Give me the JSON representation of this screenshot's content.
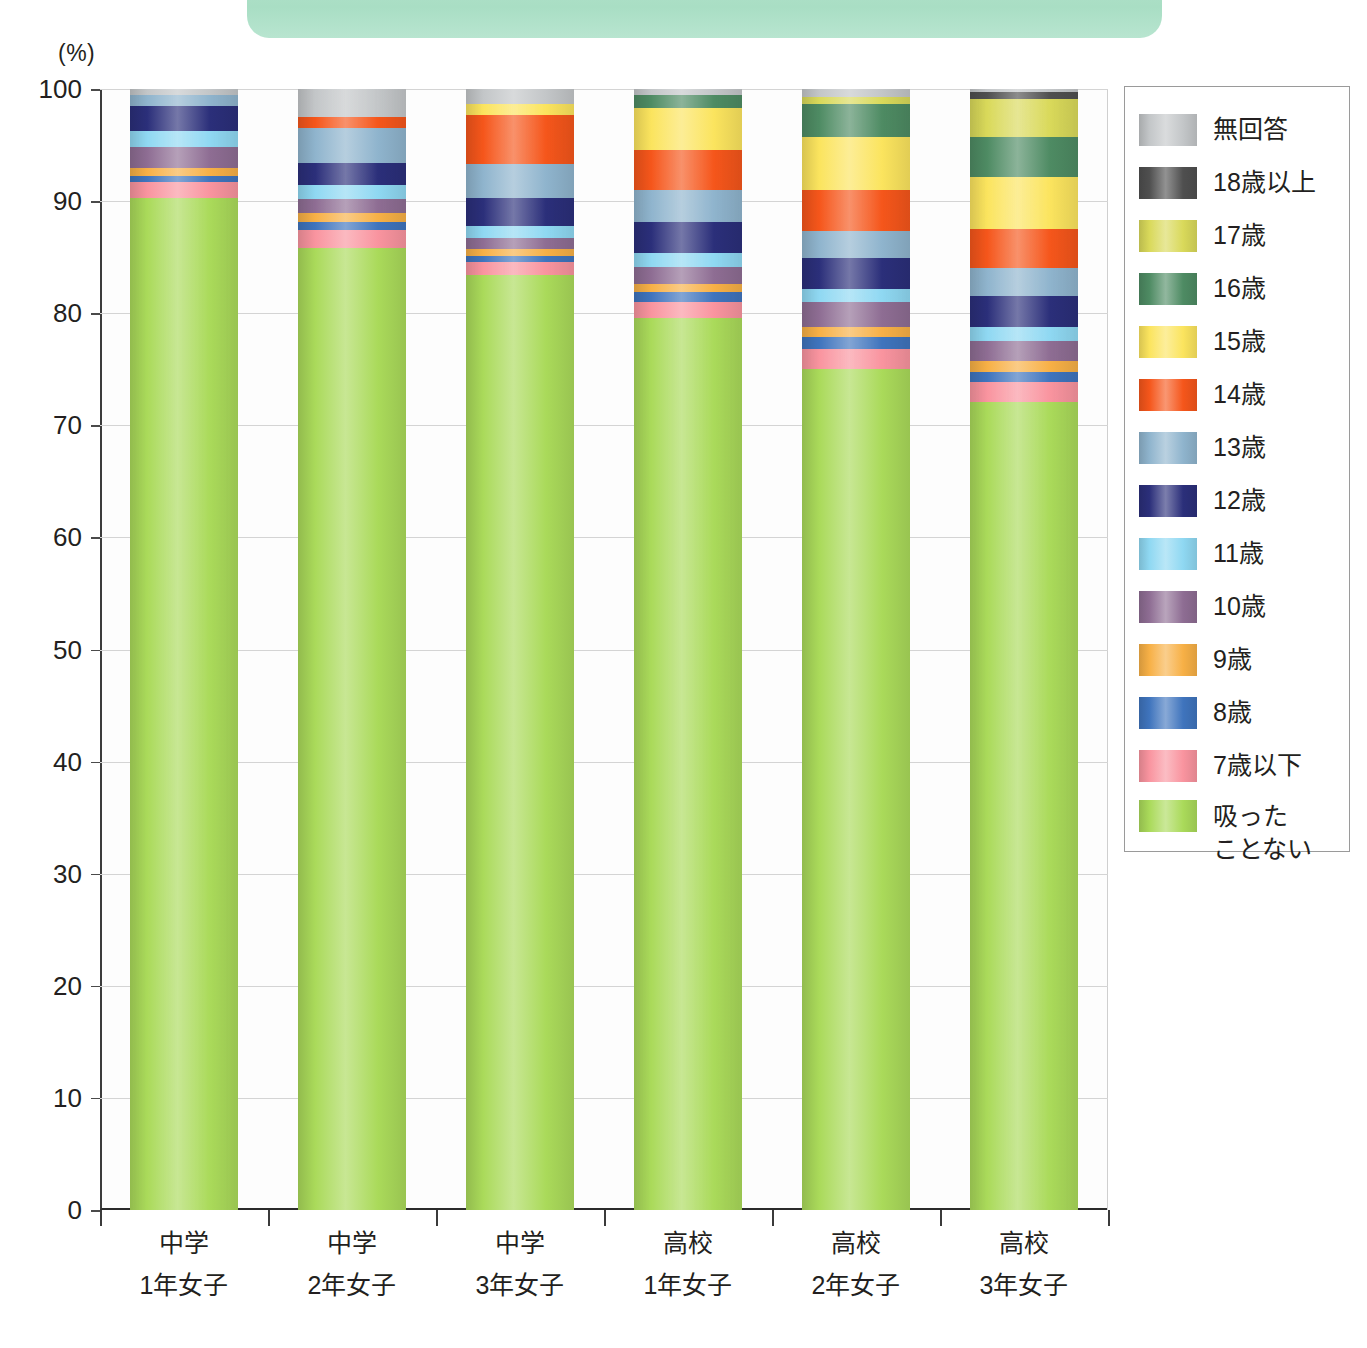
{
  "banner": {
    "label": ""
  },
  "axis": {
    "unit_label": "(%)",
    "y_ticks": [
      "100",
      "90",
      "80",
      "70",
      "60",
      "50",
      "40",
      "30",
      "20",
      "10",
      "0"
    ],
    "y_min": 0,
    "y_max": 100
  },
  "legend": {
    "items": [
      {
        "label": "無回答",
        "color": "#c3c6c8"
      },
      {
        "label": "18歳以上",
        "color": "#4f4f4f"
      },
      {
        "label": "17歳",
        "color": "#d9d95a"
      },
      {
        "label": "16歳",
        "color": "#4e8b63"
      },
      {
        "label": "15歳",
        "color": "#fbe45e"
      },
      {
        "label": "14歳",
        "color": "#f5561b"
      },
      {
        "label": "13歳",
        "color": "#8fb4cd"
      },
      {
        "label": "12歳",
        "color": "#2b2f7a"
      },
      {
        "label": "11歳",
        "color": "#8fd8f2"
      },
      {
        "label": "10歳",
        "color": "#8e6d93"
      },
      {
        "label": "9歳",
        "color": "#f7b046"
      },
      {
        "label": "8歳",
        "color": "#3f74bd"
      },
      {
        "label": "7歳以下",
        "color": "#f9949f"
      },
      {
        "label": "吸った\nことない",
        "color": "#aada5a"
      }
    ]
  },
  "chart_data": {
    "type": "bar",
    "title": "",
    "xlabel": "",
    "ylabel": "(%)",
    "ylim": [
      0,
      100
    ],
    "stacked": true,
    "grid": true,
    "legend_position": "right",
    "categories": [
      "中学\n1年女子",
      "中学\n2年女子",
      "中学\n3年女子",
      "高校\n1年女子",
      "高校\n2年女子",
      "高校\n3年女子"
    ],
    "series": [
      {
        "name": "吸ったことない",
        "color": "#aada5a",
        "values": [
          90.3,
          85.8,
          83.4,
          79.6,
          75.0,
          72.1
        ]
      },
      {
        "name": "7歳以下",
        "color": "#f9949f",
        "values": [
          1.4,
          1.6,
          1.2,
          1.4,
          1.8,
          1.8
        ]
      },
      {
        "name": "8歳",
        "color": "#3f74bd",
        "values": [
          0.5,
          0.7,
          0.5,
          0.9,
          1.1,
          0.9
        ]
      },
      {
        "name": "9歳",
        "color": "#f7b046",
        "values": [
          0.8,
          0.8,
          0.6,
          0.7,
          0.9,
          0.9
        ]
      },
      {
        "name": "10歳",
        "color": "#8e6d93",
        "values": [
          1.8,
          1.3,
          1.0,
          1.5,
          2.2,
          1.8
        ]
      },
      {
        "name": "11歳",
        "color": "#8fd8f2",
        "values": [
          1.5,
          1.2,
          1.1,
          1.3,
          1.2,
          1.3
        ]
      },
      {
        "name": "12歳",
        "color": "#2b2f7a",
        "values": [
          2.2,
          2.0,
          2.5,
          2.7,
          2.7,
          2.7
        ]
      },
      {
        "name": "13歳",
        "color": "#8fb4cd",
        "values": [
          1.0,
          3.1,
          3.0,
          2.9,
          2.4,
          2.5
        ]
      },
      {
        "name": "14歳",
        "color": "#f5561b",
        "values": [
          0.0,
          1.0,
          4.4,
          3.6,
          3.7,
          3.5
        ]
      },
      {
        "name": "15歳",
        "color": "#fbe45e",
        "values": [
          0.0,
          0.0,
          1.0,
          3.7,
          4.7,
          4.7
        ]
      },
      {
        "name": "16歳",
        "color": "#4e8b63",
        "values": [
          0.0,
          0.0,
          0.0,
          1.2,
          3.0,
          3.5
        ]
      },
      {
        "name": "17歳",
        "color": "#d9d95a",
        "values": [
          0.0,
          0.0,
          0.0,
          0.0,
          0.6,
          3.4
        ]
      },
      {
        "name": "18歳以上",
        "color": "#4f4f4f",
        "values": [
          0.0,
          0.0,
          0.0,
          0.0,
          0.0,
          0.6
        ]
      },
      {
        "name": "無回答",
        "color": "#c3c6c8",
        "values": [
          0.5,
          2.5,
          1.3,
          0.5,
          0.7,
          0.3
        ]
      }
    ]
  }
}
